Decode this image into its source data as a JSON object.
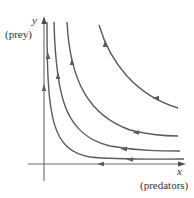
{
  "figure": {
    "type": "phase-plane",
    "axes": {
      "y": {
        "variable": "y",
        "description": "(prey)"
      },
      "x": {
        "variable": "x",
        "description": "(predators)"
      }
    },
    "trajectories": [
      {
        "name": "trajectory-1",
        "level": 1,
        "direction": "up-then-left"
      },
      {
        "name": "trajectory-2",
        "level": 2,
        "direction": "up-then-left"
      },
      {
        "name": "trajectory-3",
        "level": 3,
        "direction": "up-then-left"
      },
      {
        "name": "trajectory-4",
        "level": 4,
        "direction": "up-then-left"
      }
    ],
    "axis_flows": {
      "y_axis": "up",
      "x_axis": "left"
    },
    "colors": {
      "curve": "#5a5a5a",
      "axis": "#6b6b6b",
      "text": "#333333",
      "background": "#ffffff"
    }
  }
}
